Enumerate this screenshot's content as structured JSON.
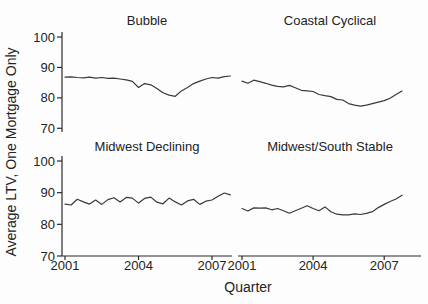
{
  "figure": {
    "ylabel": "Average LTV, One Mortgage Only",
    "xlabel": "Quarter"
  },
  "chart_data": {
    "type": "line",
    "layout": "2x2 small multiples, shared axes",
    "xlabel": "Quarter",
    "ylabel": "Average LTV, One Mortgage Only",
    "x_start": 2001.0,
    "x_step": 0.25,
    "x_ticks": [
      "2001",
      "2004",
      "2007"
    ],
    "x_tick_values": [
      2001,
      2004,
      2007
    ],
    "y_ticks": [
      "100",
      "90",
      "80",
      "70"
    ],
    "y_tick_values": [
      100,
      90,
      80,
      70
    ],
    "ylim": [
      70,
      100
    ],
    "xlim": [
      2001,
      2008
    ],
    "grid": "off",
    "legend": "none",
    "line_color": "#3a3a3a",
    "panels": [
      {
        "title": "Bubble",
        "values": [
          86.8,
          86.9,
          86.7,
          86.6,
          86.8,
          86.5,
          86.7,
          86.4,
          86.5,
          86.2,
          85.9,
          85.4,
          83.4,
          84.7,
          84.3,
          83.1,
          81.7,
          80.9,
          80.5,
          82.3,
          83.4,
          84.7,
          85.5,
          86.2,
          86.7,
          86.5,
          87.0,
          87.2
        ]
      },
      {
        "title": "Coastal Cyclical",
        "values": [
          85.5,
          84.8,
          85.8,
          85.3,
          84.8,
          84.2,
          83.8,
          83.6,
          84.1,
          83.3,
          82.5,
          82.3,
          82.1,
          81.1,
          80.7,
          80.4,
          79.5,
          79.3,
          78.1,
          77.6,
          77.3,
          77.6,
          78.1,
          78.6,
          79.1,
          79.9,
          81.1,
          82.3
        ]
      },
      {
        "title": "Midwest Declining",
        "values": [
          86.4,
          86.1,
          87.9,
          87.1,
          86.4,
          87.7,
          86.3,
          87.8,
          88.4,
          87.1,
          88.5,
          88.3,
          86.7,
          88.2,
          88.6,
          87.0,
          86.5,
          88.3,
          87.1,
          86.1,
          87.4,
          87.9,
          86.3,
          87.3,
          87.7,
          88.9,
          89.9,
          89.3
        ]
      },
      {
        "title": "Midwest/South Stable",
        "values": [
          85.0,
          84.2,
          85.2,
          85.1,
          85.2,
          84.6,
          85.0,
          84.3,
          83.5,
          84.3,
          85.1,
          85.9,
          85.0,
          84.3,
          85.5,
          84.0,
          83.2,
          83.0,
          83.0,
          83.3,
          83.1,
          83.5,
          84.0,
          85.3,
          86.3,
          87.2,
          88.0,
          89.2
        ]
      }
    ]
  }
}
